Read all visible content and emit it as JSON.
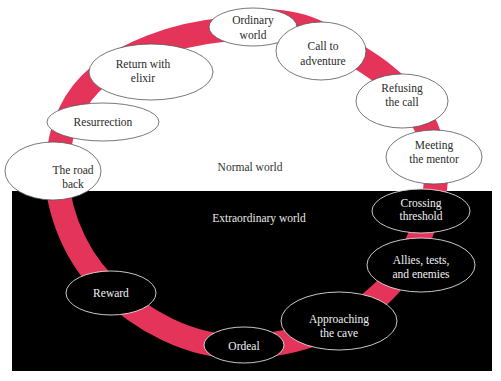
{
  "colors": {
    "ribbon": "#e5345a",
    "extraordinary_bg": "#000000",
    "normal_bg": "#ffffff"
  },
  "regions": {
    "normal": {
      "label": "Normal world"
    },
    "extraordinary": {
      "label": "Extraordinary world"
    }
  },
  "stages": [
    {
      "id": "ordinary-world",
      "lines": [
        "Ordinary",
        "world"
      ],
      "region": "normal"
    },
    {
      "id": "call-to-adventure",
      "lines": [
        "Call to",
        "adventure"
      ],
      "region": "normal"
    },
    {
      "id": "refusing-the-call",
      "lines": [
        "Refusing",
        "the call"
      ],
      "region": "normal"
    },
    {
      "id": "meeting-the-mentor",
      "lines": [
        "Meeting",
        "the mentor"
      ],
      "region": "normal"
    },
    {
      "id": "crossing-threshold",
      "lines": [
        "Crossing",
        "threshold"
      ],
      "region": "extraordinary"
    },
    {
      "id": "allies-tests-enemies",
      "lines": [
        "Allies, tests,",
        "and enemies"
      ],
      "region": "extraordinary"
    },
    {
      "id": "approaching-the-cave",
      "lines": [
        "Approaching",
        "the cave"
      ],
      "region": "extraordinary"
    },
    {
      "id": "ordeal",
      "lines": [
        "Ordeal"
      ],
      "region": "extraordinary"
    },
    {
      "id": "reward",
      "lines": [
        "Reward"
      ],
      "region": "extraordinary"
    },
    {
      "id": "the-road-back",
      "lines": [
        "The road",
        "back"
      ],
      "region": "normal"
    },
    {
      "id": "resurrection",
      "lines": [
        "Resurrection"
      ],
      "region": "normal"
    },
    {
      "id": "return-with-elixir",
      "lines": [
        "Return with",
        "elixir"
      ],
      "region": "normal"
    }
  ]
}
